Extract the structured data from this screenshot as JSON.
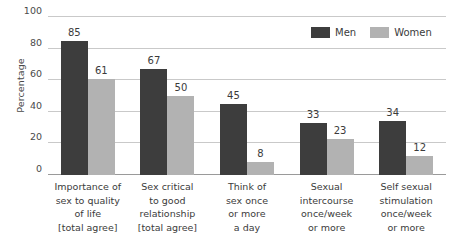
{
  "chart_data": {
    "type": "bar",
    "title": "",
    "xlabel": "",
    "ylabel": "Percentage",
    "ylim": [
      0,
      100
    ],
    "yticks": [
      0,
      20,
      40,
      60,
      80,
      100
    ],
    "ytick_labels": [
      "0",
      "20",
      "40",
      "60",
      "80",
      "100"
    ],
    "grid": true,
    "legend_position": "top-right",
    "categories": [
      "Importance of sex to quality of life [total agree]",
      "Sex critical to good relationship [total agree]",
      "Think of sex once or more a day",
      "Sexual intercourse once/week or more",
      "Self sexual stimulation once/week or more"
    ],
    "category_lines": [
      [
        "Importance of",
        "sex to quality",
        "of life",
        "[total agree]"
      ],
      [
        "Sex critical",
        "to good",
        "relationship",
        "[total agree]"
      ],
      [
        "Think of",
        "sex once",
        "or more",
        "a day"
      ],
      [
        "Sexual",
        "intercourse",
        "once/week",
        "or more"
      ],
      [
        "Self sexual",
        "stimulation",
        "once/week",
        "or more"
      ]
    ],
    "series": [
      {
        "name": "Men",
        "color": "#3d3d3d",
        "values": [
          85,
          67,
          45,
          33,
          34
        ]
      },
      {
        "name": "Women",
        "color": "#b2b2b2",
        "values": [
          61,
          50,
          8,
          23,
          12
        ]
      }
    ]
  },
  "legend": {
    "items": [
      {
        "label": "Men",
        "color": "#3d3d3d"
      },
      {
        "label": "Women",
        "color": "#b2b2b2"
      }
    ]
  },
  "axis": {
    "y_title": "Percentage"
  },
  "colors": {
    "men": "#3d3d3d",
    "women": "#b2b2b2",
    "gridline": "#c9c9c9",
    "baseline": "#9a9a9a",
    "text": "#3b3b3b",
    "background": "#ffffff"
  }
}
